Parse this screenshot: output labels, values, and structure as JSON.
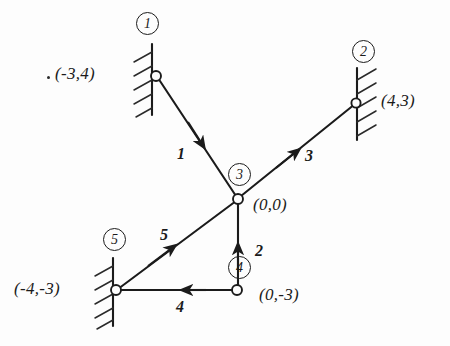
{
  "figure": {
    "ink_color": "#1b1b1b",
    "background_color": "#fdfdfd",
    "joints": [
      {
        "id": "1",
        "number_label": "1",
        "coordinate_label": "(-3,4)",
        "x": -3,
        "y": 4,
        "support": "pinned-wall",
        "px": 155,
        "py": 75
      },
      {
        "id": "2",
        "number_label": "2",
        "coordinate_label": "(4,3)",
        "x": 4,
        "y": 3,
        "support": "pinned-wall",
        "px": 355,
        "py": 102
      },
      {
        "id": "3",
        "number_label": "3",
        "coordinate_label": "(0,0)",
        "x": 0,
        "y": 0,
        "support": "free",
        "px": 238,
        "py": 198
      },
      {
        "id": "4",
        "number_label": "4",
        "coordinate_label": "(0,-3)",
        "x": 0,
        "y": -3,
        "support": "free",
        "px": 237,
        "py": 290
      },
      {
        "id": "5",
        "number_label": "5",
        "coordinate_label": "(-4,-3)",
        "x": -4,
        "y": -3,
        "support": "pinned-wall",
        "px": 115,
        "py": 290
      }
    ],
    "members": [
      {
        "id": "1",
        "label": "1",
        "from_joint": "1",
        "to_joint": "3",
        "arrow_direction": "toward-joint-3"
      },
      {
        "id": "2",
        "label": "2",
        "from_joint": "4",
        "to_joint": "3",
        "arrow_direction": "toward-joint-3"
      },
      {
        "id": "3",
        "label": "3",
        "from_joint": "3",
        "to_joint": "2",
        "arrow_direction": "toward-joint-2"
      },
      {
        "id": "4",
        "label": "4",
        "from_joint": "4",
        "to_joint": "5",
        "arrow_direction": "toward-joint-5"
      },
      {
        "id": "5",
        "label": "5",
        "from_joint": "5",
        "to_joint": "3",
        "arrow_direction": "toward-joint-3"
      }
    ],
    "caption": ""
  }
}
